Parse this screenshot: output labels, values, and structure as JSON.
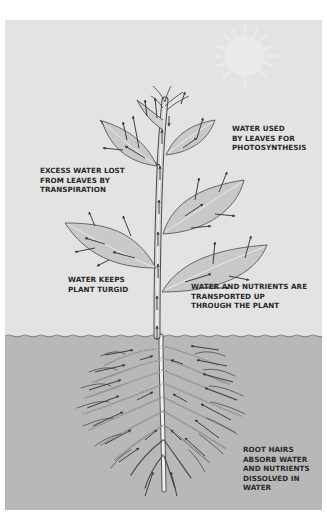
{
  "diagram": {
    "colors": {
      "sky": "#e4e4e4",
      "soil": "#b9b9b9",
      "leaf": "#c8c8c8",
      "outline": "#4a4a4a",
      "arrow": "#444444",
      "sun": "#ececec",
      "root_highlight": "#f2f2f2",
      "text": "#2a2a2a"
    },
    "regions": {
      "above_ground": "sky",
      "below_ground": "soil",
      "ground_line_y": 316
    },
    "labels": {
      "photosynthesis": "WATER USED\nBY LEAVES FOR\nPHOTOSYNTHESIS",
      "transpiration": "EXCESS WATER LOST\nFROM LEAVES BY\nTRANSPIRATION",
      "turgid": "WATER KEEPS\nPLANT TURGID",
      "transport": "WATER AND NUTRIENTS ARE\nTRANSPORTED UP\nTHROUGH THE PLANT",
      "root_hairs": "ROOT HAIRS\nABSORB WATER\nAND NUTRIENTS\nDISSOLVED IN\nWATER"
    },
    "elements": {
      "sun": "sun-icon",
      "stem": "stem",
      "leaves": [
        "leaf-upper-left",
        "leaf-upper-right",
        "leaf-middle-left",
        "leaf-middle-right",
        "leaf-lower-right",
        "bud-top"
      ],
      "roots": "root-system",
      "arrows": "water-flow-arrows"
    }
  }
}
